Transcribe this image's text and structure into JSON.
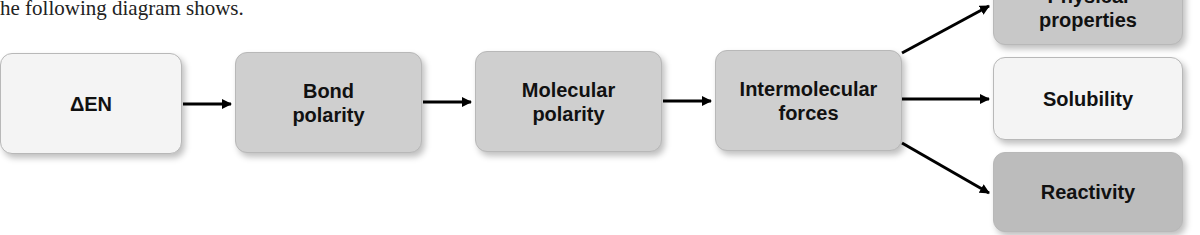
{
  "caption": "he following diagram shows.",
  "nodes": {
    "delta_en": "ΔEN",
    "bond_polarity": "Bond polarity",
    "molecular_polarity": "Molecular polarity",
    "intermolecular_forces": "Intermolecular forces",
    "physical_properties_top": "Physical",
    "physical_properties_bottom": "properties",
    "solubility": "Solubility",
    "reactivity": "Reactivity"
  },
  "colors": {
    "light_box": "#f4f4f4",
    "gray_box": "#cfcfcf",
    "dark_box": "#bcbcbc",
    "arrow": "#000000"
  },
  "edges": [
    [
      "ΔEN",
      "Bond polarity"
    ],
    [
      "Bond polarity",
      "Molecular polarity"
    ],
    [
      "Molecular polarity",
      "Intermolecular forces"
    ],
    [
      "Intermolecular forces",
      "Physical properties"
    ],
    [
      "Intermolecular forces",
      "Solubility"
    ],
    [
      "Intermolecular forces",
      "Reactivity"
    ]
  ]
}
